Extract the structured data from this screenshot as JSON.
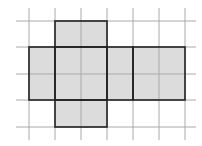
{
  "diagram": {
    "type": "cube-net-on-grid",
    "grid": {
      "x_lines": [
        29,
        55,
        81,
        107,
        133,
        159,
        185
      ],
      "y_lines": [
        21,
        47,
        74,
        100,
        127
      ],
      "x_extent": [
        16,
        196
      ],
      "y_extent": [
        8,
        140
      ],
      "line_color": "#aaaaaa"
    },
    "fill_color": "#dcdcdc",
    "outline_color": "#222222",
    "faces": [
      {
        "name": "top-face",
        "x": 55,
        "y": 21,
        "w": 52,
        "h": 26
      },
      {
        "name": "left-face",
        "x": 29,
        "y": 47,
        "w": 26,
        "h": 53
      },
      {
        "name": "front-face",
        "x": 55,
        "y": 47,
        "w": 52,
        "h": 53
      },
      {
        "name": "right-face",
        "x": 107,
        "y": 47,
        "w": 26,
        "h": 53
      },
      {
        "name": "back-face",
        "x": 133,
        "y": 47,
        "w": 52,
        "h": 53
      },
      {
        "name": "bottom-face",
        "x": 55,
        "y": 100,
        "w": 52,
        "h": 27
      }
    ]
  }
}
